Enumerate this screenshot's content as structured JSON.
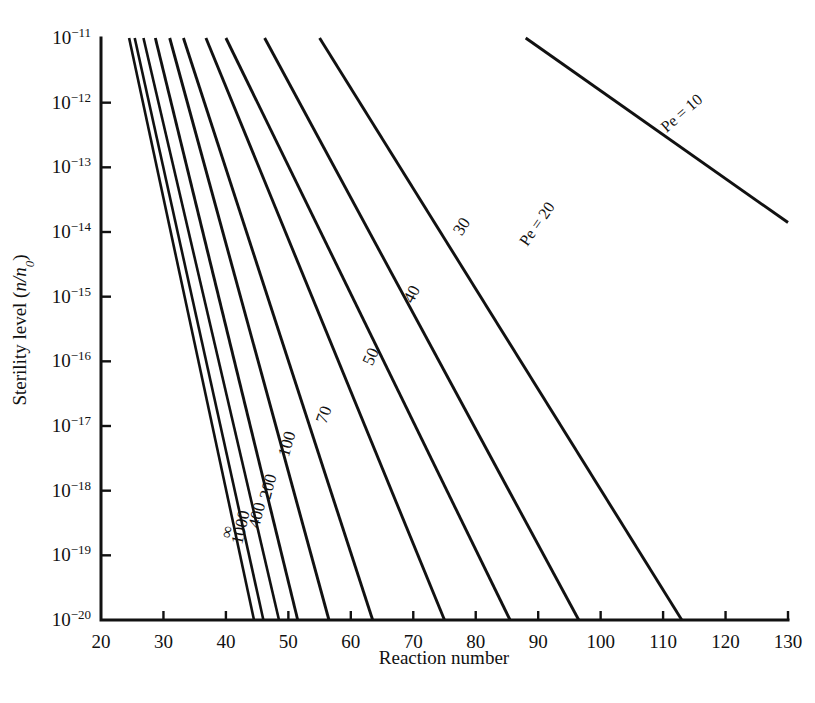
{
  "figure": {
    "faint_header_fragment": "",
    "axis_titles": {
      "x": "Reaction number",
      "y_prefix": "Sterility level (",
      "y_italic": "n/n",
      "y_sub": "0",
      "y_suffix": ")"
    }
  },
  "chart_data": {
    "type": "line",
    "title": "",
    "xlabel": "Reaction number",
    "ylabel": "Sterility level (n/n0)",
    "xlim": [
      20,
      130
    ],
    "ylim": [
      1e-20,
      1e-11
    ],
    "yscale": "log",
    "grid": false,
    "legend": "inline-curve-labels",
    "xticks": [
      20,
      30,
      40,
      50,
      60,
      70,
      80,
      90,
      100,
      110,
      120,
      130
    ],
    "xtick_labels": [
      "20",
      "30",
      "40",
      "50",
      "60",
      "70",
      "80",
      "90",
      "100",
      "110",
      "120",
      "130"
    ],
    "yticks": [
      1e-11,
      1e-12,
      1e-13,
      1e-14,
      1e-15,
      1e-16,
      1e-17,
      1e-18,
      1e-19,
      1e-20
    ],
    "ytick_labels": [
      {
        "mantissa": "10",
        "exponent": "−11"
      },
      {
        "mantissa": "10",
        "exponent": "−12"
      },
      {
        "mantissa": "10",
        "exponent": "−13"
      },
      {
        "mantissa": "10",
        "exponent": "−14"
      },
      {
        "mantissa": "10",
        "exponent": "−15"
      },
      {
        "mantissa": "10",
        "exponent": "−16"
      },
      {
        "mantissa": "10",
        "exponent": "−17"
      },
      {
        "mantissa": "10",
        "exponent": "−18"
      },
      {
        "mantissa": "10",
        "exponent": "−19"
      },
      {
        "mantissa": "10",
        "exponent": "−20"
      }
    ],
    "series": [
      {
        "name": "∞",
        "label": "∞",
        "label_style": "plain",
        "x": [
          24.5,
          44.5
        ],
        "y": [
          1e-11,
          1e-20
        ],
        "label_pos": {
          "x": 41.0,
          "y": 2.2e-19
        },
        "label_rotation": -78
      },
      {
        "name": "1000",
        "label": "1000",
        "label_style": "plain",
        "x": [
          25.4,
          46.0
        ],
        "y": [
          1e-11,
          1e-20
        ],
        "label_pos": {
          "x": 43.2,
          "y": 2.6e-19
        },
        "label_rotation": -77
      },
      {
        "name": "400",
        "label": "400",
        "label_style": "plain",
        "x": [
          26.8,
          48.5
        ],
        "y": [
          1e-11,
          1e-20
        ],
        "label_pos": {
          "x": 45.8,
          "y": 4e-19
        },
        "label_rotation": -76
      },
      {
        "name": "200",
        "label": "200",
        "label_style": "plain",
        "x": [
          28.7,
          51.5
        ],
        "y": [
          1e-11,
          1e-20
        ],
        "label_pos": {
          "x": 47.6,
          "y": 1.1e-18
        },
        "label_rotation": -75
      },
      {
        "name": "100",
        "label": "100",
        "label_style": "plain",
        "x": [
          31.0,
          56.5
        ],
        "y": [
          1e-11,
          1e-20
        ],
        "label_pos": {
          "x": 50.6,
          "y": 5e-18
        },
        "label_rotation": -73
      },
      {
        "name": "70",
        "label": "70",
        "label_style": "plain",
        "x": [
          33.2,
          63.5
        ],
        "y": [
          1e-11,
          1e-20
        ],
        "label_pos": {
          "x": 56.5,
          "y": 1.4e-17
        },
        "label_rotation": -70
      },
      {
        "name": "50",
        "label": "50",
        "label_style": "plain",
        "x": [
          36.8,
          75.0
        ],
        "y": [
          1e-11,
          1e-20
        ],
        "label_pos": {
          "x": 64.0,
          "y": 1.1e-16
        },
        "label_rotation": -66
      },
      {
        "name": "40",
        "label": "40",
        "label_style": "plain",
        "x": [
          40.0,
          85.5
        ],
        "y": [
          1e-11,
          1e-20
        ],
        "label_pos": {
          "x": 70.5,
          "y": 1e-15
        },
        "label_rotation": -62
      },
      {
        "name": "30",
        "label": "30",
        "label_style": "plain",
        "x": [
          46.2,
          96.5
        ],
        "y": [
          1e-11,
          1e-20
        ],
        "label_pos": {
          "x": 78.5,
          "y": 1.1e-14
        },
        "label_rotation": -58
      },
      {
        "name": "20",
        "label": "Pe = 20",
        "label_style": "pe",
        "x": [
          55.0,
          113.0
        ],
        "y": [
          1e-11,
          1e-20
        ],
        "label_pos": {
          "x": 90.5,
          "y": 1.2e-14
        },
        "label_rotation": -55
      },
      {
        "name": "10",
        "label": "Pe = 10",
        "label_style": "pe",
        "x": [
          88.0,
          130.0
        ],
        "y": [
          1e-11,
          1.4e-14
        ],
        "label_pos": {
          "x": 113.5,
          "y": 6e-13
        },
        "label_rotation": -41
      }
    ]
  }
}
